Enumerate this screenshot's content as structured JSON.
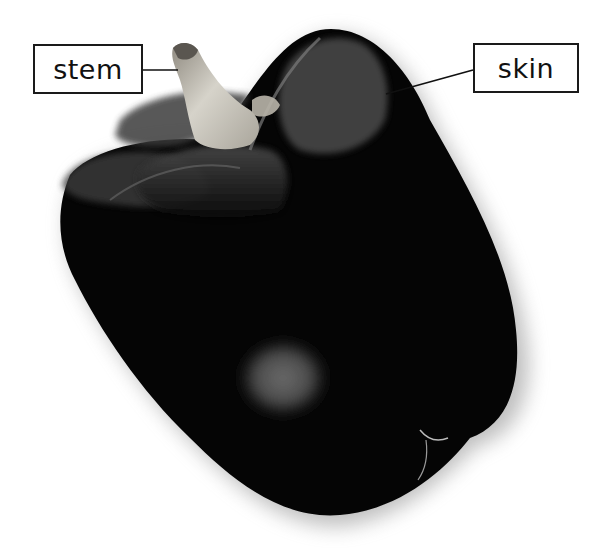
{
  "image": {
    "subject": "bell pepper",
    "background_color": "#ffffff",
    "skin_color": "#050505",
    "stem_color": "#c9c6bc"
  },
  "labels": [
    {
      "id": "stem",
      "text": "stem",
      "box": {
        "x": 33,
        "y": 44,
        "w": 110,
        "h": 50
      },
      "pointer_to": {
        "x": 178,
        "y": 70
      }
    },
    {
      "id": "skin",
      "text": "skin",
      "box": {
        "x": 473,
        "y": 43,
        "w": 106,
        "h": 50
      },
      "pointer_to": {
        "x": 386,
        "y": 94
      }
    }
  ]
}
